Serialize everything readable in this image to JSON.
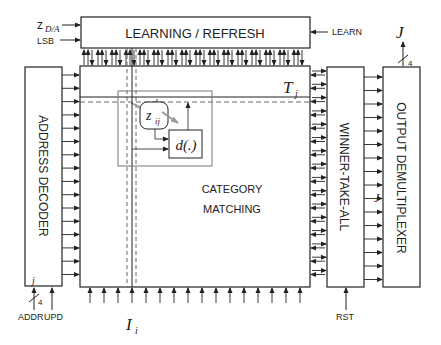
{
  "blocks": {
    "learning_refresh": "LEARNING / REFRESH",
    "address_decoder": "ADDRESS DECODER",
    "category_matching_line1": "CATEGORY",
    "category_matching_line2": "MATCHING",
    "winner_take_all": "WINNER-TAKE-ALL",
    "output_demultiplexer": "OUTPUT DEMULTIPLEXER",
    "distance_cell": "d(.)",
    "weight_cell_base": "z",
    "weight_cell_sub": "ij"
  },
  "signals": {
    "z_da_base": "z",
    "z_da_sub": "D/A",
    "lsb": "LSB",
    "learn": "LEARN",
    "addr": "ADDR",
    "upd": "UPD",
    "rst": "RST",
    "addr_index": "j",
    "addr_width": "4",
    "output_J": "J",
    "output_width": "4",
    "winner_J": "J",
    "row_T_base": "T",
    "row_T_sub": "j",
    "col_I_base": "I",
    "col_I_sub": "i"
  },
  "colors": {
    "line": "#222222",
    "dashed": "#666666",
    "highlight_box": "#777777",
    "grey_arrow": "#999999"
  }
}
